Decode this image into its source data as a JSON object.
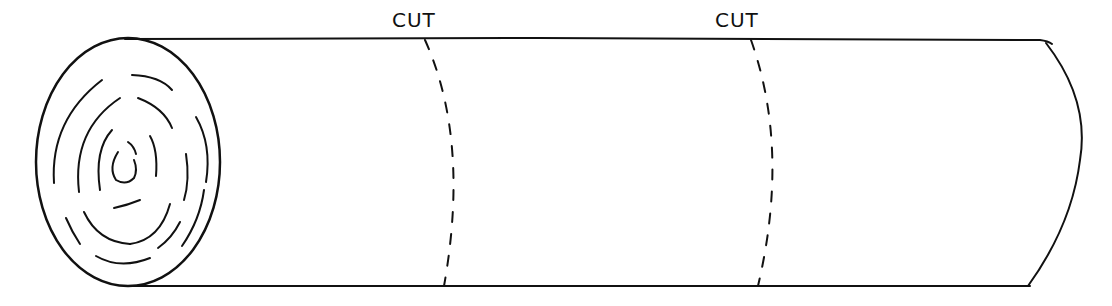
{
  "diagram": {
    "colors": {
      "line": "#111111",
      "background": "#ffffff"
    },
    "cut_labels": [
      {
        "text": "CUT",
        "x": 398,
        "y": 26
      },
      {
        "text": "CUT",
        "x": 714,
        "y": 26
      }
    ]
  }
}
